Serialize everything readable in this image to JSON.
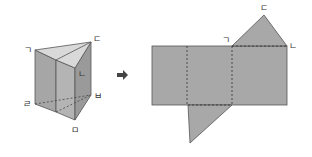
{
  "prism": {
    "labels": {
      "top_left": "ㄱ",
      "front_top": "ㄴ",
      "top_right": "ㄷ",
      "bottom_left": "ㄹ",
      "bottom_front": "ㅁ",
      "bottom_right": "ㅂ"
    }
  },
  "arrow": {
    "icon": "right-arrow-icon"
  },
  "net": {
    "labels": {
      "left": "ㄱ",
      "right": "ㄴ",
      "apex": "ㄷ"
    }
  },
  "colors": {
    "face": "#a8a8a8",
    "face_light": "#d9d9d9",
    "face_mid": "#bdbdbd",
    "edge": "#555555",
    "arrow": "#444444"
  }
}
